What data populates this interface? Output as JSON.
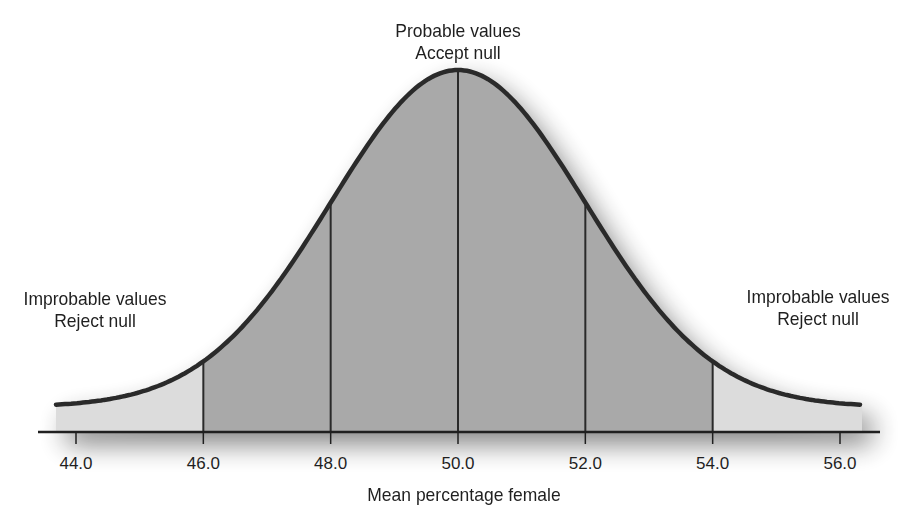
{
  "chart_data": {
    "type": "area",
    "title": "",
    "xlabel": "Mean percentage female",
    "ylabel": "",
    "distribution": "normal",
    "mean": 50.0,
    "sd": 2.0,
    "xlim": [
      43.6,
      56.4
    ],
    "x_ticks": [
      "44.0",
      "46.0",
      "48.0",
      "50.0",
      "52.0",
      "54.0",
      "56.0"
    ],
    "x_tick_values": [
      44,
      46,
      48,
      50,
      52,
      54,
      56
    ],
    "vertical_lines_at": [
      46,
      48,
      50,
      52,
      54
    ],
    "regions": [
      {
        "name": "left-tail",
        "from": 43.6,
        "to": 46,
        "shade": "light"
      },
      {
        "name": "center",
        "from": 46,
        "to": 54,
        "shade": "dark"
      },
      {
        "name": "right-tail",
        "from": 54,
        "to": 56.4,
        "shade": "light"
      }
    ],
    "annotations": [
      {
        "text": [
          "Probable values",
          "Accept null"
        ],
        "position": "top-center"
      },
      {
        "text": [
          "Improbable values",
          "Reject null"
        ],
        "position": "left"
      },
      {
        "text": [
          "Improbable values",
          "Reject null"
        ],
        "position": "right"
      }
    ],
    "grid": false,
    "legend": null
  },
  "labels": {
    "center_line1": "Probable values",
    "center_line2": "Accept null",
    "left_line1": "Improbable values",
    "left_line2": "Reject null",
    "right_line1": "Improbable values",
    "right_line2": "Reject null",
    "xlabel": "Mean percentage female"
  },
  "colors": {
    "center_fill": "#a9a9a9",
    "tail_fill": "#dcdcdc",
    "curve": "#2a2a2a",
    "axis": "#1f1f1f"
  }
}
